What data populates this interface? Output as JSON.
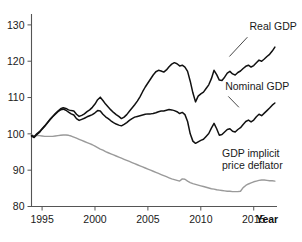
{
  "chart_data": {
    "type": "line",
    "title": "",
    "subtitle": "",
    "xlabel": "Year",
    "ylabel": "",
    "xlim": [
      1994,
      2017.2
    ],
    "ylim": [
      80,
      133
    ],
    "grid": false,
    "legend_position": "inline-annotations",
    "yticks": [
      80,
      90,
      100,
      110,
      120,
      130
    ],
    "xticks": [
      1995,
      2000,
      2005,
      2010,
      2015
    ],
    "ytick_labels": [
      "80",
      "90",
      "100",
      "110",
      "120",
      "130"
    ],
    "xtick_labels": [
      "1995",
      "2000",
      "2005",
      "2010",
      "2015"
    ],
    "note": "Index values, all series normalized to 100 at start of sample (1994)",
    "series": [
      {
        "name": "Real GDP",
        "color": "#111111",
        "label_position": {
          "x": 2014.6,
          "y": 128.5
        },
        "x": [
          1994.0,
          1994.25,
          1994.5,
          1994.75,
          1995.0,
          1995.25,
          1995.5,
          1995.75,
          1996.0,
          1996.25,
          1996.5,
          1996.75,
          1997.0,
          1997.25,
          1997.5,
          1997.75,
          1998.0,
          1998.25,
          1998.5,
          1998.75,
          1999.0,
          1999.25,
          1999.5,
          1999.75,
          2000.0,
          2000.25,
          2000.5,
          2000.75,
          2001.0,
          2001.25,
          2001.5,
          2001.75,
          2002.0,
          2002.25,
          2002.5,
          2002.75,
          2003.0,
          2003.25,
          2003.5,
          2003.75,
          2004.0,
          2004.25,
          2004.5,
          2004.75,
          2005.0,
          2005.25,
          2005.5,
          2005.75,
          2006.0,
          2006.25,
          2006.5,
          2006.75,
          2007.0,
          2007.25,
          2007.5,
          2007.75,
          2008.0,
          2008.25,
          2008.5,
          2008.75,
          2009.0,
          2009.25,
          2009.5,
          2009.75,
          2010.0,
          2010.25,
          2010.5,
          2010.75,
          2011.0,
          2011.25,
          2011.5,
          2011.75,
          2012.0,
          2012.25,
          2012.5,
          2012.75,
          2013.0,
          2013.25,
          2013.5,
          2013.75,
          2014.0,
          2014.25,
          2014.5,
          2014.75,
          2015.0,
          2015.25,
          2015.5,
          2015.75,
          2016.0,
          2016.25,
          2016.5,
          2016.75,
          2017.0
        ],
        "values": [
          99.6,
          99.2,
          100.0,
          100.6,
          101.4,
          102.2,
          103.1,
          104.0,
          104.8,
          105.6,
          106.3,
          106.9,
          107.2,
          107.0,
          106.6,
          106.4,
          106.3,
          105.4,
          104.8,
          105.1,
          105.5,
          106.1,
          106.6,
          107.3,
          108.2,
          109.4,
          110.1,
          109.2,
          108.2,
          107.4,
          106.6,
          105.9,
          105.3,
          104.8,
          104.2,
          104.6,
          105.3,
          106.2,
          107.1,
          108.0,
          109.0,
          110.2,
          111.6,
          112.9,
          114.0,
          115.1,
          116.2,
          117.1,
          117.5,
          117.3,
          117.0,
          117.6,
          118.5,
          119.2,
          119.6,
          119.3,
          118.7,
          118.9,
          118.4,
          117.2,
          114.5,
          111.3,
          108.8,
          110.4,
          111.0,
          111.5,
          112.5,
          113.5,
          115.2,
          117.5,
          116.3,
          114.8,
          114.7,
          115.6,
          116.7,
          117.2,
          116.5,
          116.2,
          116.9,
          117.3,
          118.0,
          118.6,
          118.9,
          118.4,
          118.8,
          119.6,
          120.3,
          120.0,
          120.6,
          121.3,
          121.9,
          122.8,
          123.9
        ]
      },
      {
        "name": "Nominal GDP",
        "color": "#111111",
        "label_position": {
          "x": 2012.3,
          "y": 112.0
        },
        "x": [
          1994.0,
          1994.25,
          1994.5,
          1994.75,
          1995.0,
          1995.25,
          1995.5,
          1995.75,
          1996.0,
          1996.25,
          1996.5,
          1996.75,
          1997.0,
          1997.25,
          1997.5,
          1997.75,
          1998.0,
          1998.25,
          1998.5,
          1998.75,
          1999.0,
          1999.25,
          1999.5,
          1999.75,
          2000.0,
          2000.25,
          2000.5,
          2000.75,
          2001.0,
          2001.25,
          2001.5,
          2001.75,
          2002.0,
          2002.25,
          2002.5,
          2002.75,
          2003.0,
          2003.25,
          2003.5,
          2003.75,
          2004.0,
          2004.25,
          2004.5,
          2004.75,
          2005.0,
          2005.25,
          2005.5,
          2005.75,
          2006.0,
          2006.25,
          2006.5,
          2006.75,
          2007.0,
          2007.25,
          2007.5,
          2007.75,
          2008.0,
          2008.25,
          2008.5,
          2008.75,
          2009.0,
          2009.25,
          2009.5,
          2009.75,
          2010.0,
          2010.25,
          2010.5,
          2010.75,
          2011.0,
          2011.25,
          2011.5,
          2011.75,
          2012.0,
          2012.25,
          2012.5,
          2012.75,
          2013.0,
          2013.25,
          2013.5,
          2013.75,
          2014.0,
          2014.25,
          2014.5,
          2014.75,
          2015.0,
          2015.25,
          2015.5,
          2015.75,
          2016.0,
          2016.25,
          2016.5,
          2016.75,
          2017.0
        ],
        "values": [
          99.4,
          99.0,
          99.8,
          100.4,
          101.3,
          102.1,
          103.0,
          103.9,
          104.7,
          105.4,
          106.1,
          106.6,
          106.8,
          106.5,
          106.0,
          105.5,
          105.2,
          104.2,
          103.7,
          104.0,
          104.3,
          104.7,
          105.0,
          105.3,
          105.8,
          106.4,
          106.3,
          105.4,
          104.7,
          104.2,
          103.6,
          103.1,
          102.7,
          102.4,
          102.2,
          102.6,
          103.1,
          103.7,
          104.2,
          104.6,
          104.8,
          105.0,
          105.2,
          105.4,
          105.5,
          105.5,
          105.6,
          105.8,
          106.1,
          106.3,
          106.3,
          106.5,
          106.7,
          106.6,
          106.4,
          106.1,
          105.6,
          105.9,
          105.3,
          103.4,
          100.0,
          98.0,
          97.4,
          97.8,
          98.2,
          98.5,
          99.3,
          100.1,
          101.6,
          102.9,
          101.4,
          99.6,
          99.8,
          100.5,
          101.2,
          101.4,
          100.7,
          100.5,
          101.2,
          101.7,
          102.6,
          103.4,
          103.8,
          103.3,
          103.8,
          104.7,
          105.4,
          105.0,
          105.7,
          106.4,
          107.1,
          107.9,
          108.5
        ]
      },
      {
        "name": "GDP implicit price deflator",
        "color": "#9a9a9a",
        "label_position": {
          "x": 2012.0,
          "y": 93.5
        },
        "x": [
          1994.0,
          1994.25,
          1994.5,
          1994.75,
          1995.0,
          1995.25,
          1995.5,
          1995.75,
          1996.0,
          1996.25,
          1996.5,
          1996.75,
          1997.0,
          1997.25,
          1997.5,
          1997.75,
          1998.0,
          1998.25,
          1998.5,
          1998.75,
          1999.0,
          1999.25,
          1999.5,
          1999.75,
          2000.0,
          2000.25,
          2000.5,
          2000.75,
          2001.0,
          2001.25,
          2001.5,
          2001.75,
          2002.0,
          2002.25,
          2002.5,
          2002.75,
          2003.0,
          2003.25,
          2003.5,
          2003.75,
          2004.0,
          2004.25,
          2004.5,
          2004.75,
          2005.0,
          2005.25,
          2005.5,
          2005.75,
          2006.0,
          2006.25,
          2006.5,
          2006.75,
          2007.0,
          2007.25,
          2007.5,
          2007.75,
          2008.0,
          2008.25,
          2008.5,
          2008.75,
          2009.0,
          2009.25,
          2009.5,
          2009.75,
          2010.0,
          2010.25,
          2010.5,
          2010.75,
          2011.0,
          2011.25,
          2011.5,
          2011.75,
          2012.0,
          2012.25,
          2012.5,
          2012.75,
          2013.0,
          2013.25,
          2013.5,
          2013.75,
          2014.0,
          2014.25,
          2014.5,
          2014.75,
          2015.0,
          2015.25,
          2015.5,
          2015.75,
          2016.0,
          2016.25,
          2016.5,
          2016.75,
          2017.0
        ],
        "values": [
          99.8,
          99.3,
          99.5,
          99.5,
          99.4,
          99.3,
          99.3,
          99.3,
          99.3,
          99.4,
          99.5,
          99.6,
          99.7,
          99.7,
          99.6,
          99.4,
          99.1,
          98.8,
          98.5,
          98.2,
          97.9,
          97.6,
          97.3,
          97.0,
          96.6,
          96.2,
          95.8,
          95.5,
          95.1,
          94.8,
          94.5,
          94.2,
          93.9,
          93.6,
          93.3,
          93.0,
          92.7,
          92.4,
          92.1,
          91.8,
          91.5,
          91.2,
          90.9,
          90.6,
          90.3,
          90.0,
          89.7,
          89.4,
          89.1,
          88.8,
          88.5,
          88.2,
          87.9,
          87.6,
          87.4,
          87.2,
          87.0,
          87.6,
          87.5,
          87.0,
          86.6,
          86.3,
          86.1,
          85.9,
          85.7,
          85.5,
          85.3,
          85.1,
          84.9,
          84.8,
          84.6,
          84.5,
          84.4,
          84.3,
          84.2,
          84.2,
          84.1,
          84.1,
          84.1,
          84.2,
          85.2,
          85.8,
          86.2,
          86.5,
          86.8,
          87.0,
          87.2,
          87.3,
          87.3,
          87.2,
          87.1,
          87.1,
          87.0
        ]
      }
    ]
  },
  "axis": {
    "year_label": "Year"
  }
}
